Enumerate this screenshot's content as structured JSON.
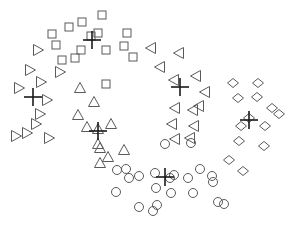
{
  "chart_data": {
    "type": "scatter",
    "title": "",
    "xlabel": "",
    "ylabel": "",
    "grid": false,
    "axes_visible": false,
    "legend": null,
    "xlim": [
      0,
      289
    ],
    "ylim": [
      0,
      228
    ],
    "marker_color": "#5a5a5a",
    "centroid_color": "#1a1a1a",
    "series": [
      {
        "name": "cluster-squares",
        "marker": "square",
        "points": [
          [
            102,
            15
          ],
          [
            69,
            27
          ],
          [
            82,
            22
          ],
          [
            52,
            34
          ],
          [
            56,
            45
          ],
          [
            98,
            33
          ],
          [
            127,
            33
          ],
          [
            91,
            36
          ],
          [
            106,
            50
          ],
          [
            81,
            50
          ],
          [
            124,
            46
          ],
          [
            133,
            57
          ],
          [
            62,
            60
          ],
          [
            75,
            58
          ],
          [
            106,
            84
          ]
        ],
        "centroid": [
          92,
          40
        ]
      },
      {
        "name": "cluster-right-triangles",
        "marker": "triangle-right",
        "points": [
          [
            38,
            50
          ],
          [
            30,
            70
          ],
          [
            60,
            72
          ],
          [
            41,
            82
          ],
          [
            19,
            88
          ],
          [
            47,
            100
          ],
          [
            40,
            114
          ],
          [
            36,
            124
          ],
          [
            27,
            133
          ],
          [
            16,
            136
          ],
          [
            49,
            138
          ]
        ],
        "centroid": [
          33,
          97
        ]
      },
      {
        "name": "cluster-up-triangles",
        "marker": "triangle-up",
        "points": [
          [
            80,
            88
          ],
          [
            94,
            102
          ],
          [
            78,
            115
          ],
          [
            87,
            127
          ],
          [
            111,
            124
          ],
          [
            98,
            129
          ],
          [
            98,
            144
          ],
          [
            108,
            157
          ],
          [
            124,
            150
          ],
          [
            100,
            163
          ],
          [
            100,
            148
          ]
        ],
        "centroid": [
          98,
          131
        ]
      },
      {
        "name": "cluster-left-triangles",
        "marker": "triangle-left",
        "points": [
          [
            151,
            48
          ],
          [
            179,
            53
          ],
          [
            160,
            67
          ],
          [
            196,
            76
          ],
          [
            174,
            80
          ],
          [
            205,
            92
          ],
          [
            199,
            106
          ],
          [
            175,
            108
          ],
          [
            193,
            110
          ],
          [
            172,
            124
          ],
          [
            194,
            126
          ],
          [
            175,
            139
          ],
          [
            190,
            138
          ]
        ],
        "centroid": [
          180,
          87
        ]
      },
      {
        "name": "cluster-diamonds",
        "marker": "diamond",
        "points": [
          [
            233,
            83
          ],
          [
            258,
            83
          ],
          [
            238,
            98
          ],
          [
            257,
            97
          ],
          [
            272,
            108
          ],
          [
            249,
            118
          ],
          [
            279,
            114
          ],
          [
            241,
            126
          ],
          [
            265,
            126
          ],
          [
            239,
            141
          ],
          [
            264,
            146
          ],
          [
            229,
            160
          ],
          [
            243,
            171
          ]
        ],
        "centroid": [
          249,
          120
        ]
      },
      {
        "name": "cluster-circles",
        "marker": "circle",
        "points": [
          [
            165,
            144
          ],
          [
            191,
            143
          ],
          [
            117,
            170
          ],
          [
            126,
            169
          ],
          [
            139,
            176
          ],
          [
            155,
            173
          ],
          [
            170,
            178
          ],
          [
            200,
            169
          ],
          [
            212,
            176
          ],
          [
            116,
            192
          ],
          [
            156,
            188
          ],
          [
            171,
            193
          ],
          [
            193,
            193
          ],
          [
            218,
            202
          ],
          [
            139,
            207
          ],
          [
            153,
            211
          ],
          [
            174,
            175
          ],
          [
            157,
            205
          ],
          [
            224,
            204
          ],
          [
            129,
            178
          ],
          [
            188,
            178
          ],
          [
            213,
            182
          ]
        ],
        "centroid": [
          165,
          177
        ]
      }
    ]
  }
}
